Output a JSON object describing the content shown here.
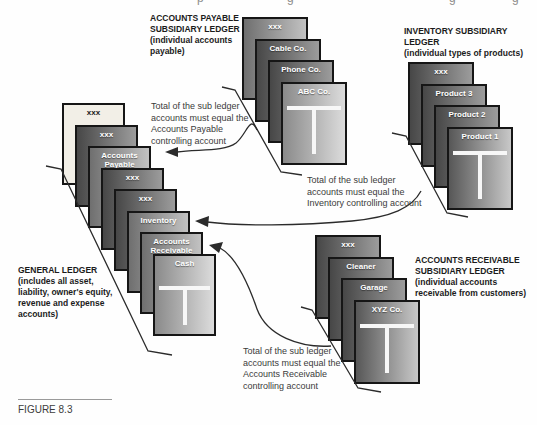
{
  "figure_label": "FIGURE 8.3",
  "headers": {
    "accounts_payable": {
      "lines": [
        "ACCOUNTS PAYABLE",
        "SUBSIDIARY LEDGER",
        "(individual accounts",
        "payable)"
      ]
    },
    "inventory": {
      "lines": [
        "INVENTORY SUBSIDIARY",
        "LEDGER",
        "(individual types of products)"
      ]
    },
    "accounts_receivable": {
      "lines": [
        "ACCOUNTS RECEIVABLE",
        "SUBSIDIARY LEDGER",
        "(individual accounts",
        "receivable from customers)"
      ]
    },
    "general_ledger": {
      "lines": [
        "GENERAL LEDGER",
        "(includes all asset,",
        "liability, owner's equity,",
        "revenue and expense",
        "accounts)"
      ]
    }
  },
  "annotations": {
    "accounts_payable": {
      "lines": [
        "Total of the sub ledger",
        "accounts must equal the",
        "Accounts Payable",
        "controlling account"
      ]
    },
    "inventory": {
      "lines": [
        "Total of the sub ledger",
        "accounts must equal the",
        "Inventory controlling account"
      ]
    },
    "accounts_receivable": {
      "lines": [
        "Total of the sub ledger",
        "accounts must equal the",
        "Accounts Receivable",
        "controlling account"
      ]
    }
  },
  "stacks": {
    "accounts_payable": {
      "cards": [
        {
          "label": "xxx",
          "tone": "mid"
        },
        {
          "label": "Cable Co.",
          "tone": "dark"
        },
        {
          "label": "Phone Co.",
          "tone": "dark"
        },
        {
          "label": "ABC Co.",
          "tone": "front"
        }
      ]
    },
    "inventory": {
      "cards": [
        {
          "label": "xxx",
          "tone": "dark"
        },
        {
          "label": "Product 3",
          "tone": "dark"
        },
        {
          "label": "Product 2",
          "tone": "dark"
        },
        {
          "label": "Product 1",
          "tone": "front-dark"
        }
      ]
    },
    "general_ledger": {
      "cards": [
        {
          "label": "xxx",
          "tone": "cream"
        },
        {
          "label": "xxx",
          "tone": "dark"
        },
        {
          "label": "Accounts Payable",
          "tone": "mid"
        },
        {
          "label": "xxx",
          "tone": "dark"
        },
        {
          "label": "xxx",
          "tone": "dark"
        },
        {
          "label": "Inventory",
          "tone": "mid"
        },
        {
          "label": "Accounts Receivable",
          "tone": "mid"
        },
        {
          "label": "Cash",
          "tone": "front"
        }
      ]
    },
    "accounts_receivable": {
      "cards": [
        {
          "label": "xxx",
          "tone": "dark"
        },
        {
          "label": "Cleaner",
          "tone": "dark"
        },
        {
          "label": "Garage",
          "tone": "dark"
        },
        {
          "label": "XYZ Co.",
          "tone": "front-dark"
        }
      ]
    }
  },
  "crop_fragments": [
    "p",
    "g",
    "g",
    "g"
  ],
  "colors": {
    "card-border": "#161616",
    "tone-cream": "#f2efe7",
    "dark-start": "#474747",
    "dark-end": "#9c9c9c",
    "mid-start": "#6f6f6f",
    "mid-end": "#c2c2c2",
    "front-start": "#8a8a8a",
    "front-end": "#dcdcdc",
    "frontdark-start": "#575757",
    "frontdark-end": "#c8c8c8",
    "card-label": "#ffffff",
    "ink": "#1b1b1b",
    "note": "#3b3b3b",
    "line": "#2b2b2b"
  }
}
